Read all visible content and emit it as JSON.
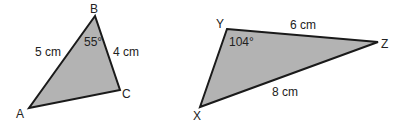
{
  "triangles": [
    {
      "name": "ABC",
      "vertices": {
        "A": "A",
        "B": "B",
        "C": "C"
      },
      "sides": {
        "AB": "5 cm",
        "BC": "4 cm"
      },
      "angle": {
        "vertex": "B",
        "label": "55°"
      }
    },
    {
      "name": "XYZ",
      "vertices": {
        "X": "X",
        "Y": "Y",
        "Z": "Z"
      },
      "sides": {
        "YZ": "6 cm",
        "XZ": "8 cm"
      },
      "angle": {
        "vertex": "Y",
        "label": "104°"
      }
    }
  ],
  "colors": {
    "fill": "#b3b3b3",
    "stroke": "#1a1a1a",
    "text": "#222222"
  }
}
